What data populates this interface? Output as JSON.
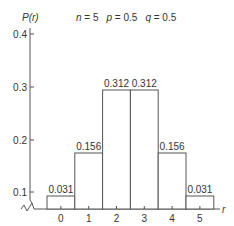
{
  "chart_data": {
    "type": "bar",
    "ylabel": "P(r)",
    "xlabel": "r",
    "parameters": {
      "n": "5",
      "p": "0.5",
      "q": "0.5"
    },
    "categories": [
      "0",
      "1",
      "2",
      "3",
      "4",
      "5"
    ],
    "values": [
      0.031,
      0.156,
      0.312,
      0.312,
      0.156,
      0.031
    ],
    "value_labels": [
      "0.031",
      "0.156",
      "0.312",
      "0.312",
      "0.156",
      "0.031"
    ],
    "yticks": [
      "0.1",
      "0.2",
      "0.3",
      "0.4"
    ],
    "ylim": [
      0,
      0.42
    ],
    "grid": false,
    "axis_break": true,
    "note": "Value labels are authoritative; drawn bar heights and y-axis tick spacing do not follow a single consistent scale."
  },
  "header": {
    "y_axis_label": "P(r)",
    "params": "n = 5   p = 0.5   q = 0.5"
  }
}
